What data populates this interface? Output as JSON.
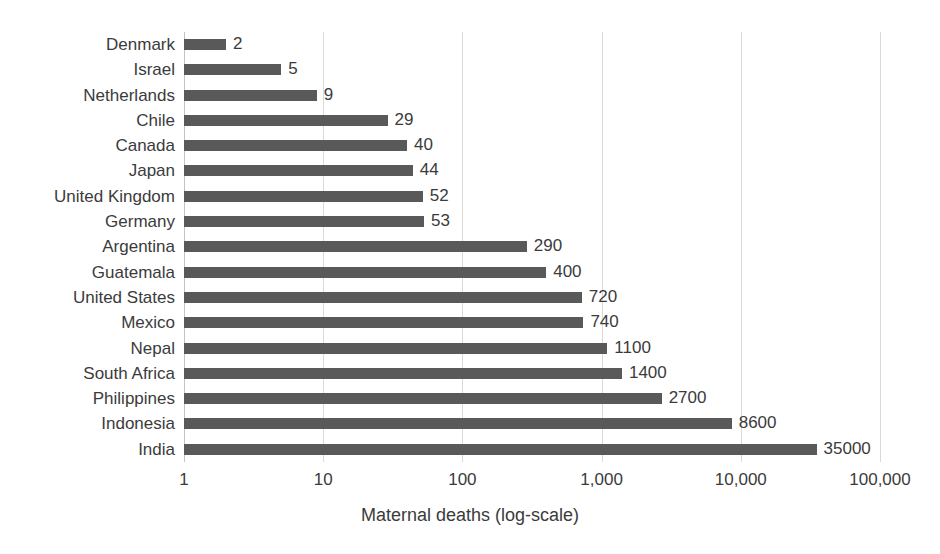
{
  "chart_data": {
    "type": "bar",
    "orientation": "horizontal",
    "title": "",
    "subtitle": "",
    "xlabel": "Maternal deaths (log-scale)",
    "ylabel": "",
    "scale": "log10",
    "xlim": [
      1,
      100000
    ],
    "grid": true,
    "gridlines_vertical": true,
    "gridlines_horizontal": false,
    "legend": false,
    "legend_position": "none",
    "bar_color": "#595959",
    "gridline_color": "#d9d9d9",
    "background_color": "#ffffff",
    "text_color": "#3b3b3b",
    "x_ticks": [
      1,
      10,
      100,
      1000,
      10000,
      100000
    ],
    "x_tick_labels": [
      "1",
      "10",
      "100",
      "1,000",
      "10,000",
      "100,000"
    ],
    "categories": [
      "Denmark",
      "Israel",
      "Netherlands",
      "Chile",
      "Canada",
      "Japan",
      "United Kingdom",
      "Germany",
      "Argentina",
      "Guatemala",
      "United States",
      "Mexico",
      "Nepal",
      "South Africa",
      "Philippines",
      "Indonesia",
      "India"
    ],
    "values": [
      2,
      5,
      9,
      29,
      40,
      44,
      52,
      53,
      290,
      400,
      720,
      740,
      1100,
      1400,
      2700,
      8600,
      35000
    ],
    "data_labels": [
      "2",
      "5",
      "9",
      "29",
      "40",
      "44",
      "52",
      "53",
      "290",
      "400",
      "720",
      "740",
      "1100",
      "1400",
      "2700",
      "8600",
      "35000"
    ],
    "data_labels_shown": true
  }
}
